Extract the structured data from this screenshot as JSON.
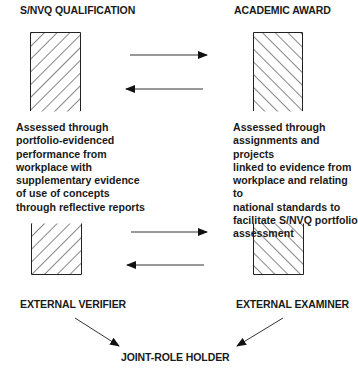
{
  "diagram": {
    "left_column": {
      "title": "S/NVQ QUALIFICATION",
      "description": "Assessed through\nportfolio-evidenced\nperformance from\nworkplace with\nsupplementary evidence\nof use of concepts\nthrough reflective reports",
      "role": "EXTERNAL VERIFIER",
      "hatch": "backslash"
    },
    "right_column": {
      "title": "ACADEMIC AWARD",
      "description": "Assessed through\nassignments and projects\nlinked to evidence from\nworkplace and relating to\nnational standards to\nfacilitate S/NVQ portfolio\nassessment",
      "role": "EXTERNAL EXAMINER",
      "hatch": "forward-slash"
    },
    "convergence": {
      "label": "JOINT-ROLE HOLDER"
    },
    "arrows": [
      {
        "id": "top-right-arrow",
        "direction": "right",
        "from": "S/NVQ QUALIFICATION",
        "to": "ACADEMIC AWARD"
      },
      {
        "id": "top-left-arrow",
        "direction": "left",
        "from": "ACADEMIC AWARD",
        "to": "S/NVQ QUALIFICATION"
      },
      {
        "id": "bottom-right-arrow",
        "direction": "right",
        "from": "EXTERNAL VERIFIER",
        "to": "EXTERNAL EXAMINER"
      },
      {
        "id": "bottom-left-arrow",
        "direction": "left",
        "from": "EXTERNAL EXAMINER",
        "to": "EXTERNAL VERIFIER"
      },
      {
        "id": "verifier-to-joint-arrow",
        "from": "EXTERNAL VERIFIER",
        "to": "JOINT-ROLE HOLDER"
      },
      {
        "id": "examiner-to-joint-arrow",
        "from": "EXTERNAL EXAMINER",
        "to": "JOINT-ROLE HOLDER"
      }
    ],
    "colors": {
      "ink": "#1a1a1a",
      "background": "#ffffff"
    }
  }
}
